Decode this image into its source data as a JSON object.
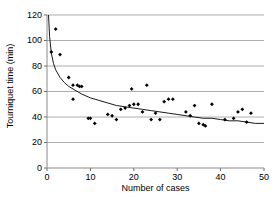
{
  "chart_data": {
    "type": "scatter",
    "title": "",
    "xlabel": "Number of cases",
    "ylabel": "Tourniquet time (min)",
    "xlim": [
      0,
      50
    ],
    "ylim": [
      0,
      120
    ],
    "xticks": [
      0,
      10,
      20,
      30,
      40,
      50
    ],
    "yticks": [
      0,
      20,
      40,
      60,
      80,
      100,
      120
    ],
    "grid": "horizontal",
    "grid_color": "#999999",
    "legend": "none",
    "marker": "diamond",
    "marker_color": "#000000",
    "trend_line_color": "#000000",
    "points": [
      {
        "x": 1,
        "y": 91
      },
      {
        "x": 2,
        "y": 109
      },
      {
        "x": 3,
        "y": 89
      },
      {
        "x": 5,
        "y": 71
      },
      {
        "x": 6,
        "y": 65
      },
      {
        "x": 6,
        "y": 54
      },
      {
        "x": 7,
        "y": 65
      },
      {
        "x": 7.5,
        "y": 64
      },
      {
        "x": 8,
        "y": 64
      },
      {
        "x": 9.5,
        "y": 39
      },
      {
        "x": 10,
        "y": 39
      },
      {
        "x": 11,
        "y": 35
      },
      {
        "x": 14,
        "y": 42
      },
      {
        "x": 15,
        "y": 41
      },
      {
        "x": 16,
        "y": 38
      },
      {
        "x": 17,
        "y": 46
      },
      {
        "x": 18,
        "y": 47
      },
      {
        "x": 19,
        "y": 49
      },
      {
        "x": 19.5,
        "y": 62
      },
      {
        "x": 20,
        "y": 50
      },
      {
        "x": 21,
        "y": 50
      },
      {
        "x": 22,
        "y": 44
      },
      {
        "x": 23,
        "y": 65
      },
      {
        "x": 24,
        "y": 38
      },
      {
        "x": 25,
        "y": 43
      },
      {
        "x": 26,
        "y": 38
      },
      {
        "x": 27,
        "y": 52
      },
      {
        "x": 28,
        "y": 54
      },
      {
        "x": 29,
        "y": 54
      },
      {
        "x": 32,
        "y": 44
      },
      {
        "x": 33,
        "y": 41
      },
      {
        "x": 34,
        "y": 49
      },
      {
        "x": 35,
        "y": 35
      },
      {
        "x": 36,
        "y": 34
      },
      {
        "x": 36.5,
        "y": 33
      },
      {
        "x": 38,
        "y": 50
      },
      {
        "x": 41,
        "y": 38
      },
      {
        "x": 43,
        "y": 39
      },
      {
        "x": 44,
        "y": 44
      },
      {
        "x": 45,
        "y": 46
      },
      {
        "x": 46,
        "y": 36
      },
      {
        "x": 47,
        "y": 43
      }
    ],
    "trend_curve": [
      {
        "x": 0.35,
        "y": 120
      },
      {
        "x": 0.6,
        "y": 103
      },
      {
        "x": 1,
        "y": 90
      },
      {
        "x": 1.5,
        "y": 82
      },
      {
        "x": 2,
        "y": 77
      },
      {
        "x": 3,
        "y": 71
      },
      {
        "x": 4,
        "y": 67
      },
      {
        "x": 5,
        "y": 64
      },
      {
        "x": 6,
        "y": 62
      },
      {
        "x": 8,
        "y": 58
      },
      {
        "x": 10,
        "y": 55
      },
      {
        "x": 12,
        "y": 53
      },
      {
        "x": 14,
        "y": 51
      },
      {
        "x": 16,
        "y": 49
      },
      {
        "x": 18,
        "y": 48
      },
      {
        "x": 20,
        "y": 47
      },
      {
        "x": 22,
        "y": 46
      },
      {
        "x": 24,
        "y": 45
      },
      {
        "x": 26,
        "y": 44
      },
      {
        "x": 28,
        "y": 43
      },
      {
        "x": 30,
        "y": 42
      },
      {
        "x": 32,
        "y": 41
      },
      {
        "x": 34,
        "y": 40
      },
      {
        "x": 36,
        "y": 39
      },
      {
        "x": 38,
        "y": 39
      },
      {
        "x": 40,
        "y": 38
      },
      {
        "x": 42,
        "y": 37
      },
      {
        "x": 44,
        "y": 37
      },
      {
        "x": 46,
        "y": 36
      },
      {
        "x": 48,
        "y": 35
      },
      {
        "x": 50,
        "y": 35
      }
    ]
  }
}
